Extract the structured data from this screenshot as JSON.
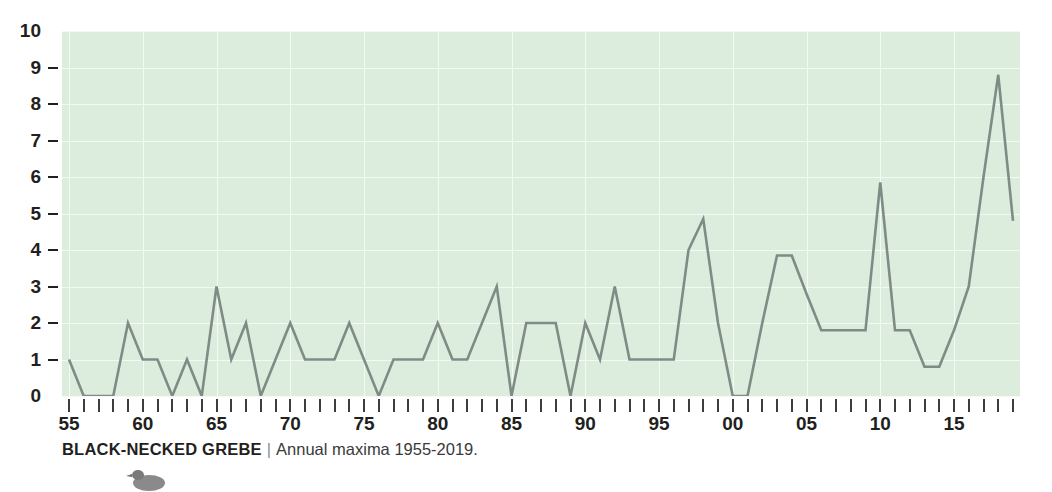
{
  "chart_data": {
    "type": "line",
    "title": "",
    "xlabel": "",
    "ylabel": "",
    "ylim": [
      0,
      10
    ],
    "xlim": [
      1955,
      2019
    ],
    "grid": true,
    "legend": "none",
    "y_ticks": [
      "10",
      "9",
      "8",
      "7",
      "6",
      "5",
      "4",
      "3",
      "2",
      "1",
      "0"
    ],
    "x_tick_labels": [
      {
        "year": 1955,
        "label": "55"
      },
      {
        "year": 1960,
        "label": "60"
      },
      {
        "year": 1965,
        "label": "65"
      },
      {
        "year": 1970,
        "label": "70"
      },
      {
        "year": 1975,
        "label": "75"
      },
      {
        "year": 1980,
        "label": "80"
      },
      {
        "year": 1985,
        "label": "85"
      },
      {
        "year": 1990,
        "label": "90"
      },
      {
        "year": 1995,
        "label": "95"
      },
      {
        "year": 2000,
        "label": "00"
      },
      {
        "year": 2005,
        "label": "05"
      },
      {
        "year": 2010,
        "label": "10"
      },
      {
        "year": 2015,
        "label": "15"
      }
    ],
    "x": [
      1955,
      1956,
      1957,
      1958,
      1959,
      1960,
      1961,
      1962,
      1963,
      1964,
      1965,
      1966,
      1967,
      1968,
      1969,
      1970,
      1971,
      1972,
      1973,
      1974,
      1975,
      1976,
      1977,
      1978,
      1979,
      1980,
      1981,
      1982,
      1983,
      1984,
      1985,
      1986,
      1987,
      1988,
      1989,
      1990,
      1991,
      1992,
      1993,
      1994,
      1995,
      1996,
      1997,
      1998,
      1999,
      2000,
      2001,
      2002,
      2003,
      2004,
      2005,
      2006,
      2007,
      2008,
      2009,
      2010,
      2011,
      2012,
      2013,
      2014,
      2015,
      2016,
      2017,
      2018,
      2019
    ],
    "values": [
      1,
      0,
      0,
      0,
      2,
      1,
      1,
      0,
      1,
      0,
      3,
      1,
      2,
      0,
      1,
      2,
      1,
      1,
      1,
      2,
      1,
      0,
      1,
      1,
      1,
      2,
      1,
      1,
      2,
      3,
      0,
      2,
      2,
      2,
      0,
      2,
      1,
      3,
      1,
      1,
      1,
      1,
      4,
      4.85,
      2,
      0,
      0,
      2,
      3.85,
      3.85,
      2.8,
      1.8,
      1.8,
      1.8,
      1.8,
      5.85,
      1.8,
      1.8,
      0.8,
      0.8,
      1.8,
      3,
      6,
      8.8,
      4.8
    ],
    "series_color": "#7f8c86",
    "plot_bg": "#dcedde",
    "grid_color": "#f3faf4",
    "text_color": "#231f20"
  },
  "caption": {
    "species": "BLACK-NECKED GREBE",
    "separator": "|",
    "description": "Annual maxima 1955-2019."
  }
}
